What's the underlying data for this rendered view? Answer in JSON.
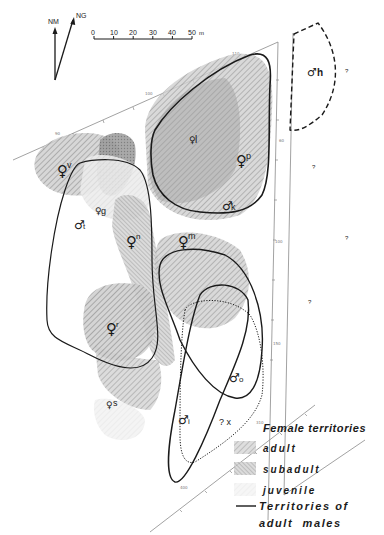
{
  "compass": {
    "north_magnetic": "NM",
    "north_geographic": "NG"
  },
  "scale_bar": {
    "ticks": [
      "0",
      "10",
      "20",
      "30",
      "40",
      "50"
    ],
    "unit": "m"
  },
  "axis_ticks": {
    "top_left": "90",
    "top_mid": "100",
    "top_right": "110",
    "right_1": "60",
    "right_2": "100",
    "right_3": "150",
    "bottom_1": "400",
    "bottom_2": "310"
  },
  "territories": {
    "females": [
      {
        "id": "v",
        "symbol": "♀",
        "label": "v",
        "class": "adult"
      },
      {
        "id": "g",
        "symbol": "♀",
        "label": "g",
        "class": "juvenile"
      },
      {
        "id": "n",
        "symbol": "♀",
        "label": "n",
        "class": "subadult"
      },
      {
        "id": "l",
        "symbol": "♀",
        "label": "l",
        "class": "juvenile"
      },
      {
        "id": "p",
        "symbol": "♀",
        "label": "p",
        "class": "adult"
      },
      {
        "id": "m",
        "symbol": "♀",
        "label": "m",
        "class": "adult"
      },
      {
        "id": "r",
        "symbol": "♀",
        "label": "r",
        "class": "adult"
      },
      {
        "id": "s",
        "symbol": "♀",
        "label": "s",
        "class": "juvenile"
      }
    ],
    "males": [
      {
        "id": "t",
        "symbol": "♂",
        "label": "t"
      },
      {
        "id": "k",
        "symbol": "♂",
        "label": "k"
      },
      {
        "id": "o",
        "symbol": "♂",
        "label": "o"
      },
      {
        "id": "i",
        "symbol": "♂",
        "label": "i"
      },
      {
        "id": "h",
        "symbol": "♂",
        "label": "h"
      }
    ],
    "unknown": [
      {
        "id": "x",
        "label": "? x"
      }
    ],
    "question_marks": [
      "?",
      "?",
      "?",
      "?"
    ]
  },
  "legend": {
    "title": "Female territories",
    "items": [
      {
        "label": "adult",
        "pattern": "adult"
      },
      {
        "label": "subadult",
        "pattern": "subadult"
      },
      {
        "label": "juvenile",
        "pattern": "juvenile"
      }
    ],
    "male_line_label_1": "Territories of",
    "male_line_label_2": "adult  males"
  },
  "colors": {
    "ink": "#1a1a1a",
    "adult_fill": "#b5b5b5",
    "subadult_fill": "#9a9a9a",
    "juvenile_fill": "#e6e6e6",
    "axis": "#888888"
  }
}
